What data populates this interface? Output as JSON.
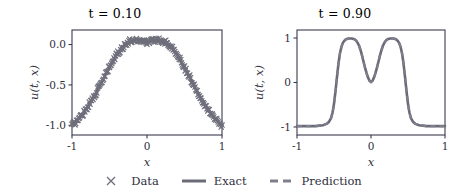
{
  "figure": {
    "background": "#ffffff",
    "line_color": "#6b6b78",
    "marker_color": "#6f6f7c",
    "axis_color": "#3b3b4f"
  },
  "legend": {
    "position": "bottom-center",
    "entries": [
      {
        "label": "Data",
        "glyph": "x-marker-icon"
      },
      {
        "label": "Exact",
        "glyph": "solid-line-icon"
      },
      {
        "label": "Prediction",
        "glyph": "dashed-line-icon"
      }
    ]
  },
  "panels": [
    {
      "id": "left",
      "title": "t = 0.10",
      "title_var": "t",
      "title_eq": " = 0.10",
      "xlabel": "x",
      "ylabel": "u(t, x)",
      "xticks": [
        "-1",
        "0",
        "1"
      ],
      "xtick_values": [
        -1,
        0,
        1
      ],
      "yticks": [
        "0.0",
        "-0.5",
        "-1.0"
      ],
      "ytick_values": [
        0.0,
        -0.5,
        -1.0
      ],
      "xlim": [
        -1.0,
        1.0
      ],
      "ylim": [
        -1.12,
        0.18
      ]
    },
    {
      "id": "right",
      "title": "t = 0.90",
      "title_var": "t",
      "title_eq": " = 0.90",
      "xlabel": "x",
      "ylabel": "u(t, x)",
      "xticks": [
        "-1",
        "0",
        "1"
      ],
      "xtick_values": [
        -1,
        0,
        1
      ],
      "yticks": [
        "1",
        "0",
        "-1"
      ],
      "ytick_values": [
        1,
        0,
        -1
      ],
      "xlim": [
        -1.0,
        1.0
      ],
      "ylim": [
        -1.18,
        1.18
      ]
    }
  ],
  "chart_data": [
    {
      "type": "line",
      "panel": "left",
      "title": "t = 0.10",
      "xlabel": "x",
      "ylabel": "u(t,x)",
      "xlim": [
        -1.0,
        1.0
      ],
      "ylim": [
        -1.12,
        0.18
      ],
      "grid": false,
      "legend_position": "bottom-center",
      "series": [
        {
          "name": "Exact",
          "style": "solid",
          "x": [
            -1.0,
            -0.95,
            -0.9,
            -0.85,
            -0.8,
            -0.75,
            -0.7,
            -0.65,
            -0.6,
            -0.55,
            -0.5,
            -0.45,
            -0.4,
            -0.35,
            -0.3,
            -0.25,
            -0.2,
            -0.15,
            -0.1,
            -0.05,
            0.0,
            0.05,
            0.1,
            0.15,
            0.2,
            0.25,
            0.3,
            0.35,
            0.4,
            0.45,
            0.5,
            0.55,
            0.6,
            0.65,
            0.7,
            0.75,
            0.8,
            0.85,
            0.9,
            0.95,
            1.0
          ],
          "y": [
            -1.0,
            -0.96,
            -0.91,
            -0.85,
            -0.78,
            -0.71,
            -0.63,
            -0.55,
            -0.46,
            -0.37,
            -0.28,
            -0.2,
            -0.12,
            -0.06,
            -0.01,
            0.03,
            0.05,
            0.06,
            0.055,
            0.04,
            0.03,
            0.04,
            0.055,
            0.06,
            0.05,
            0.03,
            -0.01,
            -0.06,
            -0.12,
            -0.2,
            -0.28,
            -0.37,
            -0.46,
            -0.55,
            -0.63,
            -0.71,
            -0.78,
            -0.85,
            -0.91,
            -0.96,
            -1.0
          ]
        },
        {
          "name": "Prediction",
          "style": "dashed",
          "x": [
            -1.0,
            -0.95,
            -0.9,
            -0.85,
            -0.8,
            -0.75,
            -0.7,
            -0.65,
            -0.6,
            -0.55,
            -0.5,
            -0.45,
            -0.4,
            -0.35,
            -0.3,
            -0.25,
            -0.2,
            -0.15,
            -0.1,
            -0.05,
            0.0,
            0.05,
            0.1,
            0.15,
            0.2,
            0.25,
            0.3,
            0.35,
            0.4,
            0.45,
            0.5,
            0.55,
            0.6,
            0.65,
            0.7,
            0.75,
            0.8,
            0.85,
            0.9,
            0.95,
            1.0
          ],
          "y": [
            -1.0,
            -0.96,
            -0.91,
            -0.85,
            -0.78,
            -0.71,
            -0.63,
            -0.55,
            -0.46,
            -0.37,
            -0.28,
            -0.2,
            -0.12,
            -0.06,
            -0.01,
            0.03,
            0.05,
            0.06,
            0.055,
            0.04,
            0.03,
            0.04,
            0.055,
            0.06,
            0.05,
            0.03,
            -0.01,
            -0.06,
            -0.12,
            -0.2,
            -0.28,
            -0.37,
            -0.46,
            -0.55,
            -0.63,
            -0.71,
            -0.78,
            -0.85,
            -0.91,
            -0.96,
            -1.0
          ]
        },
        {
          "name": "Data",
          "style": "scatter-x",
          "count": 200,
          "noise": 0.03,
          "x": [
            -1.0,
            -0.99,
            -0.98,
            -0.97,
            -0.96,
            -0.95,
            -0.94,
            -0.93,
            -0.92,
            -0.91,
            -0.9,
            -0.89,
            -0.88,
            -0.87,
            -0.86,
            -0.85,
            -0.84,
            -0.83,
            -0.82,
            -0.81,
            -0.8,
            -0.79,
            -0.78,
            -0.77,
            -0.76,
            -0.75,
            -0.74,
            -0.73,
            -0.72,
            -0.71,
            -0.7,
            -0.69,
            -0.68,
            -0.67,
            -0.66,
            -0.65,
            -0.64,
            -0.63,
            -0.62,
            -0.61,
            -0.6,
            -0.59,
            -0.58,
            -0.57,
            -0.56,
            -0.55,
            -0.54,
            -0.53,
            -0.52,
            -0.51,
            -0.5,
            -0.49,
            -0.48,
            -0.47,
            -0.46,
            -0.45,
            -0.44,
            -0.43,
            -0.42,
            -0.41,
            -0.4,
            -0.39,
            -0.38,
            -0.37,
            -0.36,
            -0.35,
            -0.34,
            -0.33,
            -0.32,
            -0.31,
            -0.3,
            -0.29,
            -0.28,
            -0.27,
            -0.26,
            -0.25,
            -0.24,
            -0.23,
            -0.22,
            -0.21,
            -0.2,
            -0.19,
            -0.18,
            -0.17,
            -0.16,
            -0.15,
            -0.14,
            -0.13,
            -0.12,
            -0.11,
            -0.1,
            -0.09,
            -0.08,
            -0.07,
            -0.06,
            -0.05,
            -0.04,
            -0.03,
            -0.02,
            -0.01,
            0.0,
            0.01,
            0.02,
            0.03,
            0.04,
            0.05,
            0.06,
            0.07,
            0.08,
            0.09,
            0.1,
            0.11,
            0.12,
            0.13,
            0.14,
            0.15,
            0.16,
            0.17,
            0.18,
            0.19,
            0.2,
            0.21,
            0.22,
            0.23,
            0.24,
            0.25,
            0.26,
            0.27,
            0.28,
            0.29,
            0.3,
            0.31,
            0.32,
            0.33,
            0.34,
            0.35,
            0.36,
            0.37,
            0.38,
            0.39,
            0.4,
            0.41,
            0.42,
            0.43,
            0.44,
            0.45,
            0.46,
            0.47,
            0.48,
            0.49,
            0.5,
            0.51,
            0.52,
            0.53,
            0.54,
            0.55,
            0.56,
            0.57,
            0.58,
            0.59,
            0.6,
            0.61,
            0.62,
            0.63,
            0.64,
            0.65,
            0.66,
            0.67,
            0.68,
            0.69,
            0.7,
            0.71,
            0.72,
            0.73,
            0.74,
            0.75,
            0.76,
            0.77,
            0.78,
            0.79,
            0.8,
            0.81,
            0.82,
            0.83,
            0.84,
            0.85,
            0.86,
            0.87,
            0.88,
            0.89,
            0.9,
            0.91,
            0.92,
            0.93,
            0.94,
            0.95,
            0.96,
            0.97,
            0.98,
            0.99,
            1.0
          ]
        }
      ]
    },
    {
      "type": "line",
      "panel": "right",
      "title": "t = 0.90",
      "xlabel": "x",
      "ylabel": "u(t,x)",
      "xlim": [
        -1.0,
        1.0
      ],
      "ylim": [
        -1.18,
        1.18
      ],
      "grid": false,
      "legend_position": "bottom-center",
      "series": [
        {
          "name": "Exact",
          "style": "solid",
          "x": [
            -1.0,
            -0.95,
            -0.9,
            -0.85,
            -0.8,
            -0.75,
            -0.7,
            -0.65,
            -0.6,
            -0.57,
            -0.54,
            -0.52,
            -0.5,
            -0.48,
            -0.46,
            -0.44,
            -0.42,
            -0.4,
            -0.38,
            -0.36,
            -0.34,
            -0.3,
            -0.26,
            -0.22,
            -0.2,
            -0.18,
            -0.16,
            -0.14,
            -0.12,
            -0.1,
            -0.08,
            -0.06,
            -0.04,
            -0.02,
            0.0,
            0.02,
            0.04,
            0.06,
            0.08,
            0.1,
            0.12,
            0.14,
            0.16,
            0.18,
            0.2,
            0.22,
            0.26,
            0.3,
            0.34,
            0.36,
            0.38,
            0.4,
            0.42,
            0.44,
            0.46,
            0.48,
            0.5,
            0.52,
            0.54,
            0.57,
            0.6,
            0.65,
            0.7,
            0.75,
            0.8,
            0.85,
            0.9,
            0.95,
            1.0
          ],
          "y": [
            -0.98,
            -0.98,
            -0.98,
            -0.98,
            -0.98,
            -0.98,
            -0.97,
            -0.96,
            -0.93,
            -0.89,
            -0.8,
            -0.68,
            -0.48,
            -0.2,
            0.12,
            0.42,
            0.65,
            0.8,
            0.89,
            0.94,
            0.97,
            0.99,
            0.99,
            0.97,
            0.94,
            0.89,
            0.82,
            0.72,
            0.6,
            0.46,
            0.33,
            0.21,
            0.11,
            0.04,
            0.01,
            0.04,
            0.11,
            0.21,
            0.33,
            0.46,
            0.6,
            0.72,
            0.82,
            0.89,
            0.94,
            0.97,
            0.99,
            0.99,
            0.97,
            0.94,
            0.89,
            0.8,
            0.65,
            0.42,
            0.12,
            -0.2,
            -0.48,
            -0.68,
            -0.8,
            -0.89,
            -0.93,
            -0.96,
            -0.97,
            -0.98,
            -0.98,
            -0.98,
            -0.98,
            -0.98,
            -0.98
          ]
        },
        {
          "name": "Prediction",
          "style": "dashed",
          "x": [
            -1.0,
            -0.95,
            -0.9,
            -0.85,
            -0.8,
            -0.75,
            -0.7,
            -0.65,
            -0.6,
            -0.57,
            -0.54,
            -0.52,
            -0.5,
            -0.48,
            -0.46,
            -0.44,
            -0.42,
            -0.4,
            -0.38,
            -0.36,
            -0.34,
            -0.3,
            -0.26,
            -0.22,
            -0.2,
            -0.18,
            -0.16,
            -0.14,
            -0.12,
            -0.1,
            -0.08,
            -0.06,
            -0.04,
            -0.02,
            0.0,
            0.02,
            0.04,
            0.06,
            0.08,
            0.1,
            0.12,
            0.14,
            0.16,
            0.18,
            0.2,
            0.22,
            0.26,
            0.3,
            0.34,
            0.36,
            0.38,
            0.4,
            0.42,
            0.44,
            0.46,
            0.48,
            0.5,
            0.52,
            0.54,
            0.57,
            0.6,
            0.65,
            0.7,
            0.75,
            0.8,
            0.85,
            0.9,
            0.95,
            1.0
          ],
          "y": [
            -0.98,
            -0.98,
            -0.98,
            -0.98,
            -0.98,
            -0.98,
            -0.97,
            -0.96,
            -0.93,
            -0.89,
            -0.8,
            -0.68,
            -0.48,
            -0.2,
            0.12,
            0.42,
            0.65,
            0.8,
            0.89,
            0.94,
            0.97,
            0.99,
            0.99,
            0.97,
            0.94,
            0.89,
            0.82,
            0.72,
            0.6,
            0.46,
            0.33,
            0.21,
            0.11,
            0.04,
            0.01,
            0.04,
            0.11,
            0.21,
            0.33,
            0.46,
            0.6,
            0.72,
            0.82,
            0.89,
            0.94,
            0.97,
            0.99,
            0.99,
            0.97,
            0.94,
            0.89,
            0.8,
            0.65,
            0.42,
            0.12,
            -0.2,
            -0.48,
            -0.68,
            -0.8,
            -0.89,
            -0.93,
            -0.96,
            -0.97,
            -0.98,
            -0.98,
            -0.98,
            -0.98,
            -0.98,
            -0.98
          ]
        }
      ]
    }
  ]
}
